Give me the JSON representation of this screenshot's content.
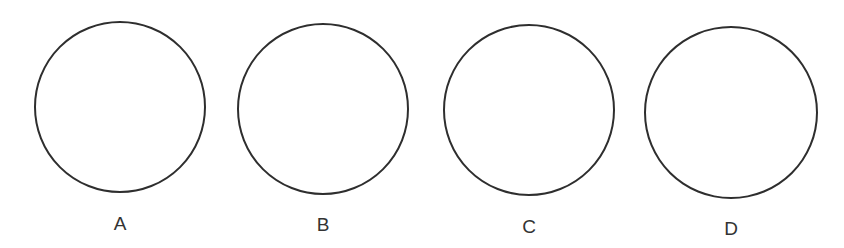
{
  "diagram": {
    "stroke_color": "#2e2e2e",
    "label_color": "#333333",
    "circles": [
      {
        "label": "A",
        "cx": 120,
        "cy": 107,
        "r": 86,
        "label_y": 215
      },
      {
        "label": "B",
        "cx": 323,
        "cy": 109,
        "r": 86,
        "label_y": 216
      },
      {
        "label": "C",
        "cx": 529,
        "cy": 110,
        "r": 86,
        "label_y": 218
      },
      {
        "label": "D",
        "cx": 731,
        "cy": 113,
        "r": 87,
        "label_y": 220
      }
    ]
  }
}
